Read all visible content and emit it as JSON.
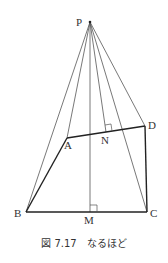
{
  "figure": {
    "caption_number": "図 7.17",
    "caption_text": "なるほど",
    "points": {
      "P": {
        "label": "P",
        "x": 90,
        "y": 22
      },
      "A": {
        "label": "A",
        "x": 67,
        "y": 138
      },
      "B": {
        "label": "B",
        "x": 26,
        "y": 212
      },
      "C": {
        "label": "C",
        "x": 147,
        "y": 212
      },
      "D": {
        "label": "D",
        "x": 145,
        "y": 126
      },
      "M": {
        "label": "M",
        "x": 90,
        "y": 212
      },
      "N": {
        "label": "N",
        "x": 106,
        "y": 132
      }
    }
  }
}
